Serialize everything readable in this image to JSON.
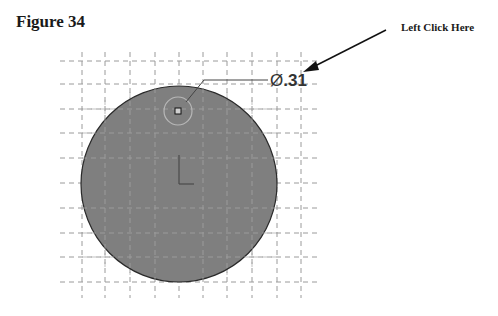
{
  "figure": {
    "title": "Figure 34"
  },
  "callout": {
    "label": "Left Click Here"
  },
  "sketch": {
    "dimension_symbol": "Ø",
    "dimension_value": ".31",
    "circle_fill": "#7f7f7f",
    "grid_color": "#9a9a9a",
    "icons": [
      "origin-axes-icon",
      "hole-center-point-icon",
      "arrow-icon"
    ]
  }
}
